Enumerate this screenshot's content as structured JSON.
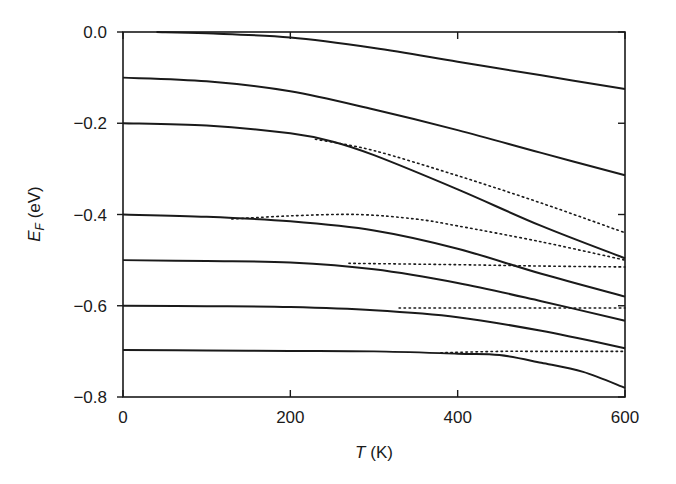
{
  "chart_data": {
    "type": "line",
    "title": "",
    "xlabel": "T (K)",
    "xlabel_italic_part": "T",
    "xlabel_unit": " (K)",
    "ylabel": "E_F (eV)",
    "ylabel_main": "E",
    "ylabel_sub": "F",
    "ylabel_unit": " (eV)",
    "xlim": [
      0,
      600
    ],
    "ylim": [
      -0.8,
      0.0
    ],
    "grid": false,
    "legend": "none",
    "x_ticks": [
      0,
      200,
      400,
      600
    ],
    "x_tick_labels": [
      "0",
      "200",
      "400",
      "600"
    ],
    "y_ticks": [
      0.0,
      -0.2,
      -0.4,
      -0.6,
      -0.8
    ],
    "y_tick_labels": [
      "0.0",
      "−0.2",
      "−0.4",
      "−0.6",
      "−0.8"
    ],
    "series": [
      {
        "name": "solid E0=0.0",
        "style": "solid",
        "points": [
          [
            40,
            0.0
          ],
          [
            100,
            -0.003
          ],
          [
            200,
            -0.012
          ],
          [
            300,
            -0.035
          ],
          [
            400,
            -0.065
          ],
          [
            500,
            -0.095
          ],
          [
            600,
            -0.125
          ]
        ]
      },
      {
        "name": "solid E0=-0.1",
        "style": "solid",
        "points": [
          [
            0,
            -0.1
          ],
          [
            100,
            -0.108
          ],
          [
            200,
            -0.13
          ],
          [
            300,
            -0.17
          ],
          [
            400,
            -0.215
          ],
          [
            500,
            -0.265
          ],
          [
            600,
            -0.314
          ]
        ]
      },
      {
        "name": "solid E0=-0.2",
        "style": "solid",
        "points": [
          [
            0,
            -0.2
          ],
          [
            100,
            -0.205
          ],
          [
            200,
            -0.222
          ],
          [
            250,
            -0.24
          ],
          [
            300,
            -0.27
          ],
          [
            400,
            -0.345
          ],
          [
            500,
            -0.425
          ],
          [
            600,
            -0.496
          ]
        ]
      },
      {
        "name": "dotted E0=-0.2",
        "style": "dotted",
        "points": [
          [
            230,
            -0.235
          ],
          [
            300,
            -0.26
          ],
          [
            400,
            -0.315
          ],
          [
            500,
            -0.375
          ],
          [
            600,
            -0.44
          ]
        ]
      },
      {
        "name": "solid E0=-0.4",
        "style": "solid",
        "points": [
          [
            0,
            -0.4
          ],
          [
            100,
            -0.405
          ],
          [
            200,
            -0.415
          ],
          [
            300,
            -0.435
          ],
          [
            400,
            -0.475
          ],
          [
            500,
            -0.53
          ],
          [
            600,
            -0.58
          ]
        ]
      },
      {
        "name": "dotted E0=-0.4",
        "style": "dotted",
        "points": [
          [
            130,
            -0.41
          ],
          [
            200,
            -0.403
          ],
          [
            280,
            -0.4
          ],
          [
            350,
            -0.41
          ],
          [
            400,
            -0.425
          ],
          [
            500,
            -0.46
          ],
          [
            600,
            -0.5
          ]
        ]
      },
      {
        "name": "solid E0=-0.5",
        "style": "solid",
        "points": [
          [
            0,
            -0.5
          ],
          [
            100,
            -0.502
          ],
          [
            200,
            -0.505
          ],
          [
            300,
            -0.52
          ],
          [
            400,
            -0.55
          ],
          [
            500,
            -0.59
          ],
          [
            600,
            -0.633
          ]
        ]
      },
      {
        "name": "dotted E0=-0.5",
        "style": "dotted",
        "points": [
          [
            270,
            -0.507
          ],
          [
            400,
            -0.51
          ],
          [
            500,
            -0.513
          ],
          [
            600,
            -0.515
          ]
        ]
      },
      {
        "name": "solid E0=-0.6",
        "style": "solid",
        "points": [
          [
            0,
            -0.6
          ],
          [
            100,
            -0.601
          ],
          [
            200,
            -0.603
          ],
          [
            300,
            -0.61
          ],
          [
            400,
            -0.625
          ],
          [
            500,
            -0.655
          ],
          [
            600,
            -0.693
          ]
        ]
      },
      {
        "name": "dotted E0=-0.6",
        "style": "dotted",
        "points": [
          [
            330,
            -0.605
          ],
          [
            400,
            -0.605
          ],
          [
            500,
            -0.605
          ],
          [
            600,
            -0.605
          ]
        ]
      },
      {
        "name": "solid E0=-0.7",
        "style": "solid",
        "points": [
          [
            0,
            -0.697
          ],
          [
            100,
            -0.698
          ],
          [
            200,
            -0.699
          ],
          [
            300,
            -0.7
          ],
          [
            400,
            -0.705
          ],
          [
            450,
            -0.708
          ],
          [
            500,
            -0.725
          ],
          [
            550,
            -0.745
          ],
          [
            600,
            -0.78
          ]
        ]
      },
      {
        "name": "dotted E0=-0.7",
        "style": "dotted",
        "points": [
          [
            380,
            -0.703
          ],
          [
            450,
            -0.7
          ],
          [
            500,
            -0.7
          ],
          [
            600,
            -0.7
          ]
        ]
      }
    ]
  },
  "colors": {
    "line": "#1a1a1a",
    "axis": "#1a1a1a",
    "background": "#ffffff"
  }
}
